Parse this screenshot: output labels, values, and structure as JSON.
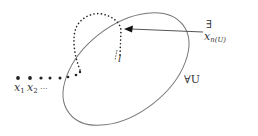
{
  "diagram": {
    "set_label": "∀U",
    "exists_symbol": "∃",
    "target_point_label": "x",
    "target_point_subscript": "n(U)",
    "line_label": "l",
    "sequence_labels": [
      {
        "base": "x",
        "sub": "1"
      },
      {
        "base": "x",
        "sub": "2"
      }
    ],
    "sequence_ellipsis": "...",
    "colors": {
      "curve": "#666666",
      "dots": "#222222",
      "text": "#333333"
    }
  }
}
